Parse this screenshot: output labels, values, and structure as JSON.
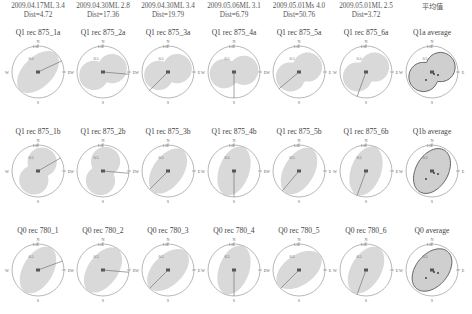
{
  "figure": {
    "columns": [
      {
        "event": "2009.04.17ML 3.4",
        "dist": "Dist=4.72",
        "cx": 38
      },
      {
        "event": "2009.04.30ML 2.8",
        "dist": "Dist=17.36",
        "cx": 103
      },
      {
        "event": "2009.04.30ML 3.4",
        "dist": "Dist=19.79",
        "cx": 168
      },
      {
        "event": "2009.05.06ML 3.1",
        "dist": "Dist=6.79",
        "cx": 234
      },
      {
        "event": "2009.05.01Ms 4.0",
        "dist": "Dist=50.76",
        "cx": 299
      },
      {
        "event": "2009.05.01ML 2.5",
        "dist": "Dist=3.72",
        "cx": 366
      },
      {
        "event": "平均值",
        "dist": "",
        "cx": 432
      }
    ],
    "rows": [
      {
        "cy": 72,
        "titles": [
          "Q1 rec 875_1a",
          "Q1 rec 875_2a",
          "Q1 rec 875_3a",
          "Q1 rec 875_4a",
          "Q1 rec 875_5a",
          "Q1 rec 875_6a",
          "Q1a average"
        ]
      },
      {
        "cy": 171,
        "titles": [
          "Q1 rec 875_1b",
          "Q1 rec 875_2b",
          "Q1 rec 875_3b",
          "Q1 rec 875_4b",
          "Q1 rec 875_5b",
          "Q1 rec 875_6b",
          "Q1b average"
        ]
      },
      {
        "cy": 270,
        "titles": [
          "Q0 rec 780_1",
          "Q0 rec 780_2",
          "Q0 rec 780_3",
          "Q0 rec 780_4",
          "Q0 rec 780_5",
          "Q0 rec 780_6",
          "Q0 average"
        ]
      }
    ],
    "axis_labels": {
      "north": "N",
      "south": "S",
      "east": "E",
      "west": "W",
      "ring_outer": "1.0",
      "ring_inner": "0.5"
    },
    "colors": {
      "fill": "#d9d9d9",
      "fill_avg": "#cfcfcf",
      "outline": "#888888",
      "line": "#666666",
      "bg": "#ffffff"
    }
  },
  "chart_data": {
    "type": "polar",
    "column_headers": [
      "2009.04.17ML 3.4 Dist=4.72",
      "2009.04.30ML 2.8 Dist=17.36",
      "2009.04.30ML 3.4 Dist=19.79",
      "2009.05.06ML 3.1 Dist=6.79",
      "2009.05.01Ms 4.0 Dist=50.76",
      "2009.05.01ML 2.5 Dist=3.72",
      "平均值"
    ],
    "row_labels": [
      "Q1 rec 875 (a)",
      "Q1 rec 875 (b)",
      "Q0 rec 780"
    ],
    "radial_ticks": [
      0.5,
      1.0
    ],
    "panels": [
      {
        "title": "Q1 rec 875_1a",
        "shape": "ellipse",
        "major_axis_deg": 45,
        "arrow_deg": 65
      },
      {
        "title": "Q1 rec 875_2a",
        "shape": "peanut",
        "major_axis_deg": 70,
        "arrow_deg": 95
      },
      {
        "title": "Q1 rec 875_3a",
        "shape": "peanut",
        "major_axis_deg": 70,
        "arrow_deg": 225
      },
      {
        "title": "Q1 rec 875_4a",
        "shape": "peanut",
        "major_axis_deg": 80,
        "arrow_deg": 180
      },
      {
        "title": "Q1 rec 875_5a",
        "shape": "peanut",
        "major_axis_deg": 60,
        "arrow_deg": 230
      },
      {
        "title": "Q1 rec 875_6a",
        "shape": "peanut",
        "major_axis_deg": 60,
        "arrow_deg": 200
      },
      {
        "title": "Q1a average",
        "shape": "peanut",
        "major_axis_deg": 60,
        "arrow_deg": null
      },
      {
        "title": "Q1 rec 875_1b",
        "shape": "peanut",
        "major_axis_deg": 25,
        "arrow_deg": 60
      },
      {
        "title": "Q1 rec 875_2b",
        "shape": "peanut",
        "major_axis_deg": 15,
        "arrow_deg": 95
      },
      {
        "title": "Q1 rec 875_3b",
        "shape": "ellipse",
        "major_axis_deg": 35,
        "arrow_deg": 225
      },
      {
        "title": "Q1 rec 875_4b",
        "shape": "ellipse",
        "major_axis_deg": 20,
        "arrow_deg": 180
      },
      {
        "title": "Q1 rec 875_5b",
        "shape": "ellipse",
        "major_axis_deg": 30,
        "arrow_deg": 220
      },
      {
        "title": "Q1 rec 875_6b",
        "shape": "ellipse",
        "major_axis_deg": 20,
        "arrow_deg": 200
      },
      {
        "title": "Q1b average",
        "shape": "ellipse",
        "major_axis_deg": 30,
        "arrow_deg": null
      },
      {
        "title": "Q0 rec 780_1",
        "shape": "ellipse",
        "major_axis_deg": 30,
        "arrow_deg": 70
      },
      {
        "title": "Q0 rec 780_2",
        "shape": "ellipse",
        "major_axis_deg": 35,
        "arrow_deg": 95
      },
      {
        "title": "Q0 rec 780_3",
        "shape": "ellipse",
        "major_axis_deg": 45,
        "arrow_deg": 225
      },
      {
        "title": "Q0 rec 780_4",
        "shape": "ellipse",
        "major_axis_deg": 20,
        "arrow_deg": 180
      },
      {
        "title": "Q0 rec 780_5",
        "shape": "ellipse",
        "major_axis_deg": 55,
        "arrow_deg": 225
      },
      {
        "title": "Q0 rec 780_6",
        "shape": "ellipse",
        "major_axis_deg": 30,
        "arrow_deg": 200
      },
      {
        "title": "Q0 average",
        "shape": "ellipse",
        "major_axis_deg": 40,
        "arrow_deg": null
      }
    ]
  }
}
